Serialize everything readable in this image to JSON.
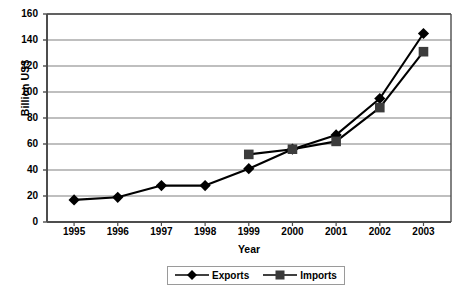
{
  "chart_data": {
    "type": "line",
    "title": "",
    "xlabel": "Year",
    "ylabel": "Billion US$",
    "categories": [
      "1995",
      "1996",
      "1997",
      "1998",
      "1999",
      "2000",
      "2001",
      "2002",
      "2003"
    ],
    "x": [
      1995,
      1996,
      1997,
      1998,
      1999,
      2000,
      2001,
      2002,
      2003
    ],
    "xlim": [
      1994.5,
      2003.5
    ],
    "ylim": [
      0,
      160
    ],
    "ytick_step": 20,
    "yticks": [
      0,
      20,
      40,
      60,
      80,
      100,
      120,
      140,
      160
    ],
    "grid": "horizontal",
    "legend_position": "bottom-center",
    "series": [
      {
        "name": "Exports",
        "marker": "diamond",
        "color": "#000000",
        "values": [
          17,
          19,
          28,
          28,
          41,
          56,
          67,
          95,
          145
        ]
      },
      {
        "name": "Imports",
        "marker": "square",
        "color": "#333333",
        "values": [
          null,
          null,
          null,
          null,
          52,
          56,
          62,
          88,
          131
        ]
      }
    ]
  },
  "axes": {
    "y_title": "Billion US$",
    "x_title": "Year",
    "y_tick_labels": [
      "0",
      "20",
      "40",
      "60",
      "80",
      "100",
      "120",
      "140",
      "160"
    ],
    "x_tick_labels": [
      "1995",
      "1996",
      "1997",
      "1998",
      "1999",
      "2000",
      "2001",
      "2002",
      "2003"
    ]
  },
  "legend": {
    "items": [
      {
        "label": "Exports",
        "marker": "diamond"
      },
      {
        "label": "Imports",
        "marker": "square"
      }
    ]
  },
  "colors": {
    "line": "#000000",
    "grid": "#808080",
    "axis": "#4d4d4d",
    "background": "#ffffff"
  }
}
